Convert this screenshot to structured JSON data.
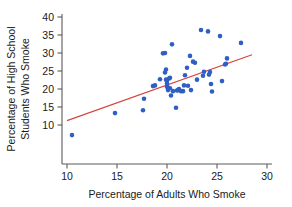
{
  "chart_data": {
    "type": "scatter",
    "title": "",
    "xlabel": "Percentage of Adults Who Smoke",
    "ylabel_line1": "Percentage of High School",
    "ylabel_line2": "Students Who Smoke",
    "xlim": [
      9.0,
      30.6
    ],
    "ylim": [
      5.5,
      41.5
    ],
    "xticks": [
      10,
      15,
      20,
      25,
      30
    ],
    "xtick_labels": [
      "10",
      "15",
      "20",
      "25",
      "30"
    ],
    "yticks": [
      10,
      15,
      20,
      25,
      30,
      35,
      40
    ],
    "ytick_labels": [
      "10",
      "15",
      "20",
      "25",
      "30",
      "35",
      "40"
    ],
    "grid": false,
    "legend": false,
    "point_color": "#2f5fc4",
    "line_color": "#d4453f",
    "axis_color": "#5a5a5a",
    "point_radius": 2.3,
    "series": [
      {
        "name": "States",
        "points": [
          [
            10.5,
            7.2
          ],
          [
            14.8,
            13.3
          ],
          [
            17.6,
            14.1
          ],
          [
            17.7,
            17.3
          ],
          [
            18.6,
            20.8
          ],
          [
            18.8,
            21.0
          ],
          [
            19.3,
            22.7
          ],
          [
            19.6,
            29.9
          ],
          [
            19.8,
            30.0
          ],
          [
            19.8,
            24.6
          ],
          [
            19.9,
            25.4
          ],
          [
            19.9,
            22.6
          ],
          [
            20.0,
            22.3
          ],
          [
            20.0,
            21.5
          ],
          [
            20.0,
            20.6
          ],
          [
            20.1,
            20.4
          ],
          [
            20.1,
            19.7
          ],
          [
            20.2,
            22.9
          ],
          [
            20.3,
            23.1
          ],
          [
            20.3,
            20.2
          ],
          [
            20.4,
            18.2
          ],
          [
            20.5,
            32.4
          ],
          [
            20.6,
            19.4
          ],
          [
            20.9,
            14.8
          ],
          [
            21.0,
            19.6
          ],
          [
            21.1,
            19.7
          ],
          [
            21.2,
            20.0
          ],
          [
            21.4,
            19.4
          ],
          [
            21.6,
            19.4
          ],
          [
            21.7,
            21.0
          ],
          [
            21.8,
            23.8
          ],
          [
            22.0,
            25.9
          ],
          [
            22.1,
            20.9
          ],
          [
            22.3,
            29.2
          ],
          [
            22.4,
            19.7
          ],
          [
            22.6,
            27.6
          ],
          [
            22.8,
            27.3
          ],
          [
            23.0,
            22.6
          ],
          [
            23.4,
            36.4
          ],
          [
            23.6,
            23.7
          ],
          [
            23.7,
            24.8
          ],
          [
            24.1,
            36.0
          ],
          [
            24.2,
            24.0
          ],
          [
            24.3,
            24.7
          ],
          [
            24.4,
            21.4
          ],
          [
            24.5,
            19.3
          ],
          [
            25.3,
            34.7
          ],
          [
            25.5,
            22.2
          ],
          [
            25.8,
            26.8
          ],
          [
            25.9,
            27.0
          ],
          [
            26.0,
            28.5
          ],
          [
            27.4,
            32.8
          ]
        ]
      }
    ],
    "fit_line": {
      "name": "Least-squares regression line",
      "x_start": 10.0,
      "y_start": 11.2,
      "x_end": 28.5,
      "y_end": 29.5
    }
  }
}
